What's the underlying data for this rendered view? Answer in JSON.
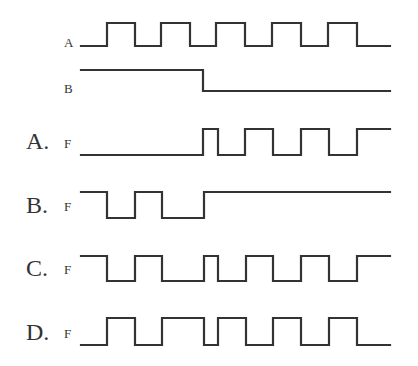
{
  "diagram": {
    "type": "timing-diagram",
    "x_start": 81,
    "x_end": 390,
    "stroke_color": "#333333",
    "inputs": [
      {
        "id": "A",
        "label": "A",
        "label_pos": [
          64,
          47
        ],
        "high_y": 23,
        "low_y": 46,
        "levels": [
          [
            81,
            0
          ],
          [
            107,
            1
          ],
          [
            135,
            0
          ],
          [
            161,
            1
          ],
          [
            190,
            0
          ],
          [
            216,
            1
          ],
          [
            245,
            0
          ],
          [
            272,
            1
          ],
          [
            301,
            0
          ],
          [
            328,
            1
          ],
          [
            357,
            0
          ],
          [
            390,
            0
          ]
        ]
      },
      {
        "id": "B",
        "label": "B",
        "label_pos": [
          64,
          93
        ],
        "high_y": 70,
        "low_y": 91,
        "levels": [
          [
            81,
            1
          ],
          [
            203,
            0
          ],
          [
            390,
            0
          ]
        ]
      }
    ],
    "options": [
      {
        "id": "A",
        "option_label": "A.",
        "signal_label": "F",
        "option_label_pos": [
          26,
          149
        ],
        "signal_label_pos": [
          64,
          148
        ],
        "high_y": 129,
        "low_y": 155,
        "levels": [
          [
            81,
            0
          ],
          [
            203,
            1
          ],
          [
            218,
            0
          ],
          [
            245,
            1
          ],
          [
            273,
            0
          ],
          [
            301,
            1
          ],
          [
            329,
            0
          ],
          [
            357,
            1
          ],
          [
            390,
            1
          ]
        ]
      },
      {
        "id": "B",
        "option_label": "B.",
        "signal_label": "F",
        "option_label_pos": [
          26,
          213
        ],
        "signal_label_pos": [
          64,
          211
        ],
        "high_y": 192,
        "low_y": 218,
        "levels": [
          [
            81,
            1
          ],
          [
            107,
            0
          ],
          [
            135,
            1
          ],
          [
            162,
            0
          ],
          [
            204,
            1
          ],
          [
            390,
            1
          ]
        ]
      },
      {
        "id": "C",
        "option_label": "C.",
        "signal_label": "F",
        "option_label_pos": [
          26,
          276
        ],
        "signal_label_pos": [
          64,
          274
        ],
        "high_y": 256,
        "low_y": 281,
        "levels": [
          [
            81,
            1
          ],
          [
            107,
            0
          ],
          [
            135,
            1
          ],
          [
            162,
            0
          ],
          [
            204,
            1
          ],
          [
            218,
            0
          ],
          [
            246,
            1
          ],
          [
            273,
            0
          ],
          [
            301,
            1
          ],
          [
            329,
            0
          ],
          [
            357,
            1
          ],
          [
            390,
            1
          ]
        ]
      },
      {
        "id": "D",
        "option_label": "D.",
        "signal_label": "F",
        "option_label_pos": [
          26,
          340
        ],
        "signal_label_pos": [
          64,
          338
        ],
        "high_y": 318,
        "low_y": 345,
        "levels": [
          [
            81,
            0
          ],
          [
            107,
            1
          ],
          [
            135,
            0
          ],
          [
            162,
            1
          ],
          [
            204,
            0
          ],
          [
            218,
            1
          ],
          [
            246,
            0
          ],
          [
            273,
            1
          ],
          [
            301,
            0
          ],
          [
            329,
            1
          ],
          [
            357,
            0
          ],
          [
            390,
            0
          ]
        ]
      }
    ]
  }
}
